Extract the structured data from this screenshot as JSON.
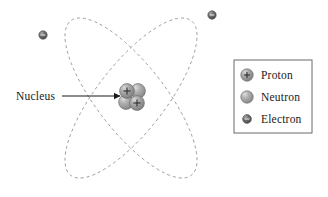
{
  "diagram": {
    "type": "atomic-model-diagram",
    "background_color": "#ffffff",
    "callout": {
      "label": "Nucleus",
      "label_x": 16,
      "label_y": 100,
      "arrow_start_x": 62,
      "arrow_start_y": 96,
      "arrow_end_x": 120,
      "arrow_end_y": 96,
      "arrow_color": "#1a1a1a"
    },
    "orbits": {
      "stroke_color": "#9a9a9a",
      "dash_pattern": "3,3",
      "stroke_width": 0.9,
      "center_x": 131,
      "center_y": 98,
      "rx": 34,
      "ry": 98,
      "rotations_deg": [
        38,
        -38
      ],
      "count": 2
    },
    "nucleus": {
      "center_x": 131,
      "center_y": 97,
      "particle_radius": 7.4,
      "particles": [
        {
          "kind": "proton",
          "label": "+",
          "cx": 127,
          "cy": 91
        },
        {
          "kind": "neutron",
          "label": "",
          "cx": 138,
          "cy": 91
        },
        {
          "kind": "neutron",
          "label": "",
          "cx": 126,
          "cy": 102
        },
        {
          "kind": "proton",
          "label": "+",
          "cx": 137,
          "cy": 103
        }
      ]
    },
    "electrons": [
      {
        "cx": 43,
        "cy": 35,
        "r": 4.2,
        "label": "-"
      },
      {
        "cx": 212,
        "cy": 15,
        "r": 4.2,
        "label": "-"
      }
    ],
    "colors": {
      "proton_fill": "#8c8c8c",
      "proton_highlight": "#cfcfcf",
      "neutron_fill": "#969696",
      "neutron_highlight": "#d4d4d4",
      "electron_fill": "#5a5a5a",
      "electron_highlight": "#a8a8a8",
      "particle_outline": "#6e6e6e",
      "orbit_stroke": "#9a9a9a",
      "text": "#1a1a1a",
      "legend_border": "#6b6b6b"
    }
  },
  "legend": {
    "box": {
      "x": 234,
      "y": 60,
      "width": 78,
      "height": 73
    },
    "border_color": "#6b6b6b",
    "border_width": 1,
    "items": [
      {
        "symbol": "proton-symbol",
        "label": "Proton",
        "sign": "+",
        "symbol_cx": 247,
        "symbol_cy": 75,
        "label_x": 261,
        "label_y": 79,
        "radius": 6.2
      },
      {
        "symbol": "neutron-symbol",
        "label": "Neutron",
        "sign": "",
        "symbol_cx": 247,
        "symbol_cy": 97,
        "label_x": 261,
        "label_y": 101,
        "radius": 6.2
      },
      {
        "symbol": "electron-symbol",
        "label": "Electron",
        "sign": "-",
        "symbol_cx": 247,
        "symbol_cy": 119,
        "label_x": 261,
        "label_y": 123,
        "radius": 4.4
      }
    ]
  }
}
